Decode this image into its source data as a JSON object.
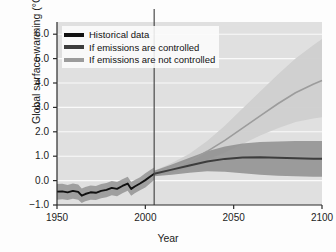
{
  "chart_data": {
    "type": "line",
    "title": "",
    "xlabel": "Year",
    "ylabel": "Global surface warming (°C)",
    "xlim": [
      1950,
      2100
    ],
    "ylim": [
      -1.0,
      6.5
    ],
    "xticks": [
      "1950",
      "2000",
      "2050",
      "2100"
    ],
    "xtick_values": [
      1950,
      2000,
      2050,
      2100
    ],
    "yticks": [
      "6.0",
      "5.0",
      "4.0",
      "3.0",
      "2.0",
      "1.0",
      "0.0",
      "−1.0"
    ],
    "ytick_values": [
      6.0,
      5.0,
      4.0,
      3.0,
      2.0,
      1.0,
      0.0,
      -1.0
    ],
    "grid": "horizontal-white",
    "legend_position": "top-left",
    "divider_year": 2005,
    "colors": {
      "historical_line": "#111111",
      "controlled_line": "#3d3d3d",
      "uncontrolled_line": "#9c9c9c",
      "controlled_band": "#8e8e8e",
      "uncontrolled_band": "#cfcfcf",
      "plot_background": "#e0e0e0",
      "gridline": "#fafafa",
      "divider": "#4a4a4a",
      "axis": "#2b2b2b"
    },
    "series": [
      {
        "name": "Historical data",
        "legend_label": "Historical data",
        "x": [
          1950,
          1953,
          1956,
          1959,
          1962,
          1964,
          1966,
          1969,
          1972,
          1975,
          1978,
          1981,
          1984,
          1987,
          1990,
          1992,
          1994,
          1997,
          2000,
          2003,
          2005
        ],
        "values": [
          -0.45,
          -0.44,
          -0.48,
          -0.42,
          -0.46,
          -0.62,
          -0.55,
          -0.48,
          -0.5,
          -0.42,
          -0.38,
          -0.3,
          -0.34,
          -0.22,
          -0.12,
          -0.34,
          -0.24,
          -0.12,
          0.02,
          0.18,
          0.28
        ],
        "band_lower": [
          -0.78,
          -0.76,
          -0.8,
          -0.74,
          -0.78,
          -0.92,
          -0.85,
          -0.78,
          -0.8,
          -0.72,
          -0.68,
          -0.6,
          -0.64,
          -0.52,
          -0.42,
          -0.62,
          -0.52,
          -0.4,
          -0.28,
          -0.1,
          0.02
        ],
        "band_upper": [
          -0.14,
          -0.13,
          -0.18,
          -0.12,
          -0.16,
          -0.32,
          -0.26,
          -0.2,
          -0.22,
          -0.14,
          -0.1,
          -0.02,
          -0.06,
          0.06,
          0.16,
          -0.06,
          0.02,
          0.14,
          0.3,
          0.44,
          0.54
        ]
      },
      {
        "name": "If emissions are controlled",
        "legend_label": "If emissions are controlled",
        "x": [
          2005,
          2015,
          2025,
          2035,
          2045,
          2055,
          2065,
          2075,
          2085,
          2095,
          2100
        ],
        "values": [
          0.28,
          0.45,
          0.62,
          0.78,
          0.89,
          0.95,
          0.96,
          0.94,
          0.92,
          0.9,
          0.9
        ],
        "band_lower": [
          0.18,
          0.24,
          0.32,
          0.38,
          0.36,
          0.3,
          0.24,
          0.2,
          0.18,
          0.16,
          0.16
        ],
        "band_upper": [
          0.4,
          0.66,
          0.94,
          1.2,
          1.4,
          1.52,
          1.58,
          1.6,
          1.62,
          1.62,
          1.62
        ]
      },
      {
        "name": "If emissions are not controlled",
        "legend_label": "If emissions are not controlled",
        "x": [
          2005,
          2015,
          2025,
          2035,
          2045,
          2055,
          2065,
          2075,
          2085,
          2095,
          2100
        ],
        "values": [
          0.28,
          0.5,
          0.8,
          1.2,
          1.65,
          2.15,
          2.65,
          3.15,
          3.6,
          3.95,
          4.1
        ],
        "band_lower": [
          0.18,
          0.32,
          0.55,
          0.85,
          1.15,
          1.5,
          1.85,
          2.15,
          2.4,
          2.55,
          2.6
        ],
        "band_upper": [
          0.4,
          0.72,
          1.1,
          1.62,
          2.25,
          2.95,
          3.65,
          4.35,
          5.0,
          5.55,
          5.8
        ]
      }
    ]
  },
  "legend": {
    "items": [
      {
        "label": "Historical data",
        "color": "#111111"
      },
      {
        "label": "If emissions are controlled",
        "color": "#3d3d3d"
      },
      {
        "label": "If emissions are not controlled",
        "color": "#9c9c9c"
      }
    ]
  }
}
